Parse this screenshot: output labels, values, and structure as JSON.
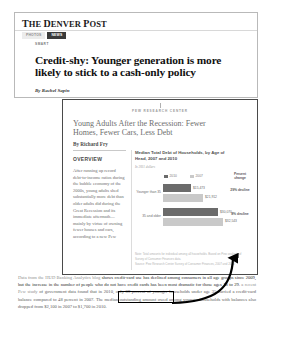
{
  "article": {
    "masthead": "The Denver Post",
    "nav_tabs": [
      {
        "label": "PHOTOS",
        "active": false
      },
      {
        "label": "NEWS",
        "active": true
      }
    ],
    "kicker": "SMART",
    "headline": "Credit-shy: Younger generation is more likely to stick to a cash-only policy",
    "byline": "By Rachel Sapin"
  },
  "blog_body": {
    "paragraph_lead": "Data from the HUD Banking Analytics blog",
    "paragraph_rest": " shows credit-card use has declined among consumers in all age groups since 2009, but the increase in the number of people who do not have credit cards has been most dramatic for those ages 18 to 29. ",
    "link_text": "a recent Pew study",
    "paragraph_tail": " of government data found that in 2010, only 39 percent of younger households under age 35 carried a credit-card balance compared to 48 percent in 2007. The median outstanding amount owed among younger households with balances also dropped from $2,100 in 2007 to $1,700 in 2010."
  },
  "pdf": {
    "brand": "PEW RESEARCH CENTER",
    "report_title": "Young Adults After the Recession: Fewer Homes, Fewer Cars, Less Debt",
    "report_byline": "By Richard Fry",
    "overview_heading": "OVERVIEW",
    "overview_body": "After running up record debt-to-income ratios during the bubble economy of the 2000s, young adults shed substantially more debt than older adults did during the Great Recession and its immediate aftermath—mainly by virtue of owning fewer houses and cars, according to a new Pew",
    "notes": [
      "Note: Total amounts for individual among all households. Based on Pew analysis of Survey of Consumer Finances data.",
      "Source: Pew Research Center Survey of Consumer Finances, 2007 and 2010"
    ]
  },
  "chart_data": {
    "type": "bar",
    "title": "Median Total Debt of Households, by Age of Head, 2007 and 2010",
    "subtitle": "In 2011 dollars",
    "orientation": "horizontal",
    "categories": [
      "Younger than 35",
      "35 and older"
    ],
    "series": [
      {
        "name": "2010",
        "color": "#6b6b6b",
        "values": [
          15473,
          21912
        ]
      },
      {
        "name": "2007",
        "color": "#c9c9c9",
        "values": [
          30070,
          32543
        ]
      }
    ],
    "rows": [
      {
        "category": "Younger than 35",
        "value_2010": 15473,
        "value_2010_label": "$15,473",
        "value_2007": 21912,
        "value_2007_label": "$21,912",
        "percent_change": "29% decline"
      },
      {
        "category": "35 and older",
        "value_2010": 30070,
        "value_2010_label": "$30,070",
        "value_2007": 32543,
        "value_2007_label": "$32,543",
        "percent_change": "8% decline"
      }
    ],
    "percent_change_header": "Percent change",
    "legend": [
      "2010",
      "2007"
    ],
    "legend_position": "top",
    "grid": false,
    "xlabel": "",
    "ylabel": ""
  }
}
